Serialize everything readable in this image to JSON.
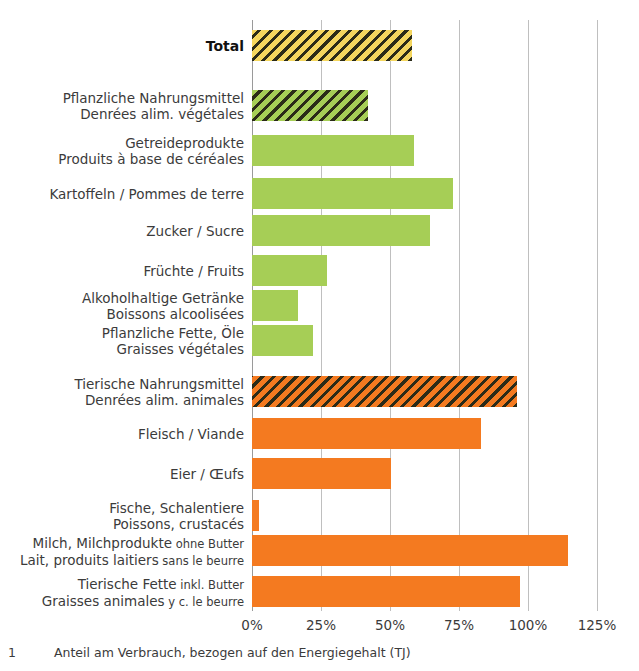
{
  "chart_data": {
    "type": "bar",
    "orientation": "horizontal",
    "title": "",
    "xlabel": "",
    "ylabel": "",
    "xlim": [
      0,
      125
    ],
    "xticks": [
      "0%",
      "25%",
      "50%",
      "75%",
      "100%",
      "125%"
    ],
    "xtick_values": [
      0,
      25,
      50,
      75,
      100,
      125
    ],
    "grid": true,
    "legend": "none",
    "colors": {
      "total": "#f4d65e",
      "plant": "#a6ce56",
      "animal": "#f47a20",
      "hatch": "#2b2b18",
      "gridline": "#bfbfbf",
      "text": "#3b3b3b"
    },
    "categories": [
      {
        "label_de": "Total",
        "label_fr": "",
        "value": 58,
        "style": "total-hatch",
        "bold": true
      },
      {
        "label_de": "Pflanzliche Nahrungsmittel",
        "label_fr": "Denrées alim. végétales",
        "value": 42,
        "style": "green-hatch",
        "bold": false
      },
      {
        "label_de": "Getreideprodukte",
        "label_fr": "Produits à base de céréales",
        "value": 58.7,
        "style": "green",
        "bold": false
      },
      {
        "label_de": "Kartoffeln / Pommes de terre",
        "label_fr": "",
        "value": 73,
        "style": "green",
        "bold": false
      },
      {
        "label_de": "Zucker / Sucre",
        "label_fr": "",
        "value": 64.5,
        "style": "green",
        "bold": false
      },
      {
        "label_de": "Früchte / Fruits",
        "label_fr": "",
        "value": 27,
        "style": "green",
        "bold": false
      },
      {
        "label_de": "Alkoholhaltige Getränke",
        "label_fr": "Boissons alcoolisées",
        "value": 16.5,
        "style": "green",
        "bold": false
      },
      {
        "label_de": "Pflanzliche Fette, Öle",
        "label_fr": "Graisses végétales",
        "value": 22,
        "style": "green",
        "bold": false
      },
      {
        "label_de": "Tierische Nahrungsmittel",
        "label_fr": "Denrées alim. animales",
        "value": 96,
        "style": "orange-hatch",
        "bold": false
      },
      {
        "label_de": "Fleisch / Viande",
        "label_fr": "",
        "value": 83,
        "style": "orange",
        "bold": false
      },
      {
        "label_de": "Eier / Œufs",
        "label_fr": "",
        "value": 50.5,
        "style": "orange",
        "bold": false
      },
      {
        "label_de": "Fische, Schalentiere",
        "label_fr": "Poissons, crustacés",
        "value": 2.5,
        "style": "orange",
        "bold": false
      },
      {
        "label_de": "Milch, Milchprodukte",
        "label_de_small": "ohne Butter",
        "label_fr": "Lait, produits laitiers",
        "label_fr_small": "sans le beurre",
        "value": 114.5,
        "style": "orange",
        "bold": false
      },
      {
        "label_de": "Tierische Fette",
        "label_de_small": "inkl. Butter",
        "label_fr": "Graisses animales",
        "label_fr_small": "y c. le beurre",
        "value": 97,
        "style": "orange",
        "bold": false
      }
    ]
  },
  "footnote": {
    "number": "1",
    "text": "Anteil am Verbrauch, bezogen auf den Energiegehalt (TJ)"
  }
}
